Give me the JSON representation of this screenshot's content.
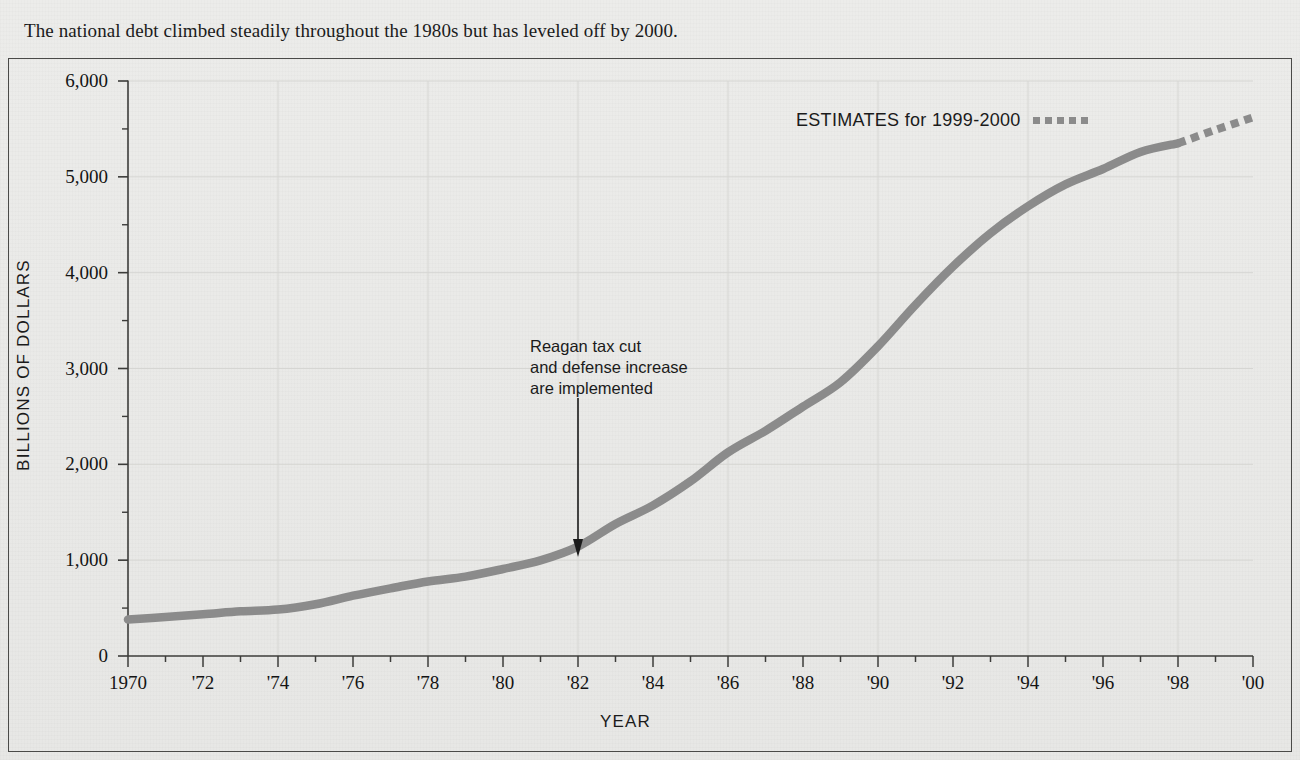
{
  "caption": "The national debt climbed steadily throughout the 1980s but has leveled off by 2000.",
  "axes": {
    "ylabel": "BILLIONS OF DOLLARS",
    "xlabel": "YEAR"
  },
  "annotation": {
    "line1": "Reagan tax cut",
    "line2": "and defense increase",
    "line3": "are implemented",
    "points_to_year": 1982,
    "points_to_value": 1000
  },
  "legend": {
    "estimates_label": "ESTIMATES for 1999-2000",
    "estimates_swatch": "dotted-line-swatch"
  },
  "colors": {
    "line": "#8b8b8b",
    "estimate_line": "#8b8b8b",
    "axis": "#3c3c3a",
    "grid": "#d6d6d3",
    "background": "#e9e9e7",
    "text": "#1b1b1b"
  },
  "chart_data": {
    "type": "line",
    "title": "The national debt climbed steadily throughout the 1980s but has leveled off by 2000.",
    "xlabel": "YEAR",
    "ylabel": "BILLIONS OF DOLLARS",
    "xlim": [
      1970,
      2000
    ],
    "ylim": [
      0,
      6000
    ],
    "grid": true,
    "legend_position": "top-right",
    "y_ticks": [
      0,
      1000,
      2000,
      3000,
      4000,
      5000,
      6000
    ],
    "y_tick_labels": [
      "0",
      "1,000",
      "2,000",
      "3,000",
      "4,000",
      "5,000",
      "6,000"
    ],
    "y_minor_tick_step": 500,
    "x_ticks": [
      1970,
      1971,
      1972,
      1973,
      1974,
      1975,
      1976,
      1977,
      1978,
      1979,
      1980,
      1981,
      1982,
      1983,
      1984,
      1985,
      1986,
      1987,
      1988,
      1989,
      1990,
      1991,
      1992,
      1993,
      1994,
      1995,
      1996,
      1997,
      1998,
      1999,
      2000
    ],
    "x_tick_labels": [
      "1970",
      "",
      "'72",
      "",
      "'74",
      "",
      "'76",
      "",
      "'78",
      "",
      "'80",
      "",
      "'82",
      "",
      "'84",
      "",
      "'86",
      "",
      "'88",
      "",
      "'90",
      "",
      "'92",
      "",
      "'94",
      "",
      "'96",
      "",
      "'98",
      "",
      "'00"
    ],
    "series": [
      {
        "name": "National debt (actual)",
        "style": "solid",
        "color": "#8b8b8b",
        "x": [
          1970,
          1971,
          1972,
          1973,
          1974,
          1975,
          1976,
          1977,
          1978,
          1979,
          1980,
          1981,
          1982,
          1983,
          1984,
          1985,
          1986,
          1987,
          1988,
          1989,
          1990,
          1991,
          1992,
          1993,
          1994,
          1995,
          1996,
          1997,
          1998
        ],
        "values": [
          380,
          408,
          436,
          466,
          484,
          541,
          629,
          706,
          777,
          829,
          908,
          998,
          1142,
          1377,
          1572,
          1823,
          2125,
          2350,
          2602,
          2857,
          3233,
          3665,
          4064,
          4411,
          4693,
          4921,
          5082,
          5260,
          5350
        ]
      },
      {
        "name": "ESTIMATES for 1999-2000",
        "style": "dotted",
        "color": "#8b8b8b",
        "x": [
          1998,
          1999,
          2000
        ],
        "values": [
          5350,
          5490,
          5620
        ]
      }
    ],
    "annotations": [
      {
        "text": "Reagan tax cut and defense increase are implemented",
        "x": 1982,
        "y": 1000,
        "arrow": "down"
      }
    ]
  }
}
